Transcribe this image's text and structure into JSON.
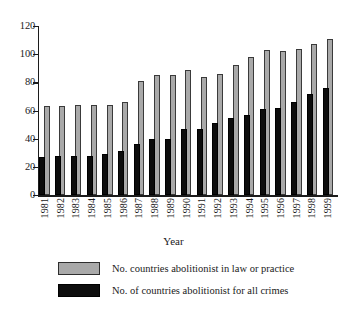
{
  "chart_data": {
    "type": "bar",
    "title": "",
    "xlabel": "Year",
    "ylabel": "",
    "ylim": [
      0,
      120
    ],
    "yticks": [
      0,
      20,
      40,
      60,
      80,
      100,
      120
    ],
    "grid": false,
    "legend_position": "bottom",
    "categories": [
      "1981",
      "1982",
      "1983",
      "1984",
      "1985",
      "1986",
      "1987",
      "1988",
      "1989",
      "1990",
      "1991",
      "1992",
      "1993",
      "1994",
      "1995",
      "1996",
      "1997",
      "1998",
      "1999"
    ],
    "series": [
      {
        "name": "No. countries abolitionist in law or practice",
        "color": "#a9a9a9",
        "values": [
          63,
          63,
          64,
          64,
          64,
          66,
          81,
          85,
          85,
          89,
          84,
          86,
          92,
          98,
          103,
          102,
          104,
          107,
          111
        ]
      },
      {
        "name": "No. of countries abolitionist for all crimes",
        "color": "#0d0d0d",
        "values": [
          27,
          28,
          28,
          28,
          29,
          31,
          36,
          40,
          40,
          47,
          47,
          51,
          55,
          57,
          61,
          62,
          66,
          72,
          76
        ]
      }
    ]
  },
  "axis": {
    "y_tick_labels": [
      "0",
      "20",
      "40",
      "60",
      "80",
      "100",
      "120"
    ],
    "x_title": "Year"
  },
  "legend": {
    "items": [
      {
        "label": "No. countries abolitionist in law or practice",
        "swatch": "grey"
      },
      {
        "label": "No. of countries abolitionist for all crimes",
        "swatch": "black"
      }
    ]
  }
}
